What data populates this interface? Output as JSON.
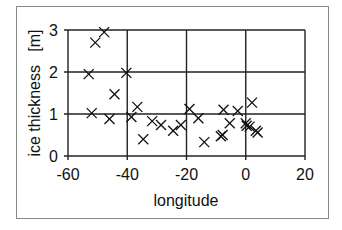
{
  "chart_data": {
    "type": "scatter",
    "title": "",
    "xlabel": "longitude",
    "ylabel": "ice thickness   [m]",
    "xlim": [
      -60,
      20
    ],
    "ylim": [
      0,
      3
    ],
    "xticks": [
      -60,
      -40,
      -20,
      0,
      20
    ],
    "yticks": [
      0,
      1,
      2,
      3
    ],
    "grid": true,
    "legend": null,
    "marker": "x",
    "series": [
      {
        "name": "ice thickness",
        "points": [
          {
            "x": -47.8,
            "y": 2.95
          },
          {
            "x": -50.8,
            "y": 2.7
          },
          {
            "x": -53.0,
            "y": 1.95
          },
          {
            "x": -40.3,
            "y": 1.98
          },
          {
            "x": -44.3,
            "y": 1.47
          },
          {
            "x": -52.0,
            "y": 1.02
          },
          {
            "x": -46.0,
            "y": 0.88
          },
          {
            "x": -38.6,
            "y": 0.93
          },
          {
            "x": -36.6,
            "y": 1.17
          },
          {
            "x": -34.6,
            "y": 0.4
          },
          {
            "x": -31.6,
            "y": 0.83
          },
          {
            "x": -28.6,
            "y": 0.74
          },
          {
            "x": -24.5,
            "y": 0.6
          },
          {
            "x": -21.9,
            "y": 0.74
          },
          {
            "x": -19.0,
            "y": 1.12
          },
          {
            "x": -16.0,
            "y": 0.9
          },
          {
            "x": -14.0,
            "y": 0.33
          },
          {
            "x": -7.5,
            "y": 1.1
          },
          {
            "x": -2.7,
            "y": 1.07
          },
          {
            "x": 2.1,
            "y": 1.27
          },
          {
            "x": -5.4,
            "y": 0.78
          },
          {
            "x": -8.4,
            "y": 0.47
          },
          {
            "x": -7.8,
            "y": 0.5
          },
          {
            "x": 0.0,
            "y": 0.78
          },
          {
            "x": 0.3,
            "y": 0.72
          },
          {
            "x": 1.3,
            "y": 0.7
          },
          {
            "x": 3.4,
            "y": 0.6
          },
          {
            "x": 4.0,
            "y": 0.56
          }
        ]
      }
    ]
  },
  "labels": {
    "xlabel": "longitude",
    "ylabel": "ice thickness   [m]",
    "xticks": [
      "-60",
      "-40",
      "-20",
      "0",
      "20"
    ],
    "yticks": [
      "0",
      "1",
      "2",
      "3"
    ]
  }
}
